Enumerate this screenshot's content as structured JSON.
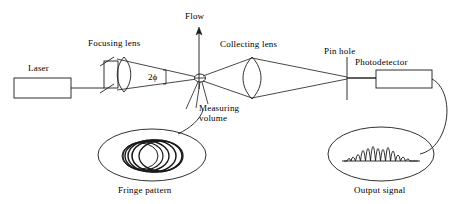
{
  "diagram": {
    "type": "schematic",
    "stroke_color": "#1a1a1a",
    "background_color": "#ffffff",
    "labels": {
      "laser": "Laser",
      "focusing_lens": "Focusing lens",
      "flow": "Flow",
      "angle": "2ϕ",
      "collecting_lens": "Collecting lens",
      "pin_hole": "Pin hole",
      "photodetector": "Photodetector",
      "measuring_volume_line1": "Measuring",
      "measuring_volume_line2": "volume",
      "fringe_pattern": "Fringe pattern",
      "output_signal": "Output signal"
    },
    "components": [
      {
        "name": "laser-source",
        "label": "Laser",
        "shape": "rectangle"
      },
      {
        "name": "beam-splitter",
        "label": "",
        "shape": "rectangle"
      },
      {
        "name": "focusing-lens",
        "label": "Focusing lens",
        "shape": "biconvex-lens"
      },
      {
        "name": "measuring-volume",
        "label": "Measuring volume",
        "shape": "small-ellipse"
      },
      {
        "name": "collecting-lens",
        "label": "Collecting lens",
        "shape": "biconvex-lens"
      },
      {
        "name": "pin-hole",
        "label": "Pin hole",
        "shape": "vertical-line"
      },
      {
        "name": "photodetector",
        "label": "Photodetector",
        "shape": "rectangle"
      },
      {
        "name": "fringe-pattern-inset",
        "label": "Fringe pattern",
        "shape": "ellipse-with-concentric-fringes"
      },
      {
        "name": "output-signal-inset",
        "label": "Output signal",
        "shape": "ellipse-with-doppler-burst"
      }
    ],
    "flow_arrow": {
      "label": "Flow",
      "direction": "up"
    },
    "beam_angle": {
      "label": "2ϕ",
      "description": "half-angle between crossing beams"
    },
    "output_signal_trace": {
      "type": "doppler-burst",
      "peak_count": 9,
      "envelope": "gaussian",
      "relative_peak_heights": [
        0.18,
        0.34,
        0.55,
        0.8,
        1.0,
        0.8,
        0.55,
        0.34,
        0.18
      ]
    },
    "fringe_pattern_rings": 5
  }
}
